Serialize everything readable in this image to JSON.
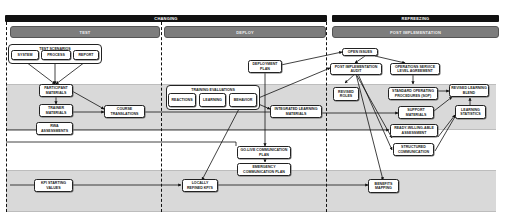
{
  "phases": [
    {
      "label": "CHANGING"
    },
    {
      "label": "REFREEZING"
    }
  ],
  "stages": [
    {
      "label": "TEST"
    },
    {
      "label": "DEPLOY"
    },
    {
      "label": "POST IMPLEMENTATION"
    }
  ],
  "groups": {
    "test_scenarios": {
      "title": "TEST SCENARIOS",
      "items": [
        "SYSTEM",
        "PROCESS",
        "REPORT"
      ]
    },
    "training_evaluations": {
      "title": "TRAINING EVALUATIONS",
      "items": [
        "REACTIONS",
        "LEARNING",
        "BEHAVIOR"
      ]
    }
  },
  "nodes": {
    "participant_materials": "PARTICIPANT MATERIALS",
    "trainer_materials": "TRAINER MATERIALS",
    "course_translations": "COURSE TRANSLATIONS",
    "rwa_assessments": "RWA ASSESSMENTS",
    "kpi_starting_values": "KPI STARTING VALUES",
    "deployment_plan": "DEPLOYMENT PLAN",
    "integrated_learning_materials": "INTEGRATED LEARNING MATERIALS",
    "go_live_communication_plan": "GO-LIVE COMMUNICATION PLAN",
    "emergency_communication_plan": "EMERGENCY COMMUNICATION PLAN",
    "locally_refined_kpis": "LOCALLY REFINED KPI'S",
    "open_issues": "OPEN ISSUES",
    "post_implementation_audit": "POST IMPLEMENTATION AUDIT",
    "operations_service_level_agreement": "OPERATIONS SERVICE LEVEL AGREEMENT",
    "revised_roles": "REVISED ROLES",
    "standard_operating_procedures": "STANDARD OPERATING PROCEDURES (SOP)",
    "revised_learning_blend": "REVISED LEARNING BLEND",
    "support_materials": "SUPPORT MATERIALS",
    "learning_statistics": "LEARNING STATISTICS",
    "ready_willing_able_assessment": "READY-WILLING-ABLE ASSESSMENT",
    "structured_communication": "STRUCTURED COMMUNICATION",
    "benefits_mapping": "BENEFITS MAPPING"
  },
  "colors": {
    "phase_bar": "#111111",
    "stage_bar": "#7d7d7d",
    "band": "#d9d9d9",
    "node_border": "#222222"
  }
}
